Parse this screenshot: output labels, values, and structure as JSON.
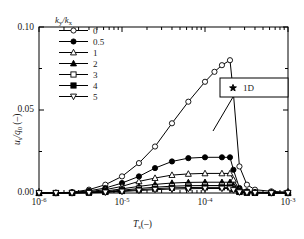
{
  "chart_data": {
    "type": "line",
    "title": "",
    "xlabel": "Ts(-)",
    "ylabel": "us/q0 (-)",
    "xscale": "log",
    "xlim": [
      1e-06,
      0.001
    ],
    "ylim": [
      0.0,
      0.1
    ],
    "yticks": [
      "0.00",
      "0.05",
      "0.10"
    ],
    "ytick_values": [
      0.0,
      0.05,
      0.1
    ],
    "xticks": [
      "10-6",
      "10-5",
      "10-4",
      "10-3"
    ],
    "xtick_values": [
      1e-06,
      1e-05,
      0.0001,
      0.001
    ],
    "grid": false,
    "legend_position": "upper-left-inside",
    "legend_title": "ky/kx",
    "series": [
      {
        "name": "0",
        "marker": "circle-open",
        "x": [
          1e-06,
          1.6e-06,
          2.5e-06,
          4e-06,
          6.3e-06,
          1e-05,
          1.6e-05,
          2.5e-05,
          4e-05,
          6.3e-05,
          0.0001,
          0.00013,
          0.00016,
          0.0002,
          0.00022,
          0.00026,
          0.00032,
          0.0004,
          0.00063,
          0.001
        ],
        "values": [
          0.0,
          0.0,
          0.0005,
          0.002,
          0.005,
          0.01,
          0.018,
          0.028,
          0.042,
          0.055,
          0.067,
          0.073,
          0.077,
          0.08,
          0.06,
          0.016,
          0.005,
          0.002,
          0.001,
          0.0005
        ]
      },
      {
        "name": "0.5",
        "marker": "circle-filled",
        "x": [
          1e-06,
          1.6e-06,
          2.5e-06,
          4e-06,
          6.3e-06,
          1e-05,
          1.6e-05,
          2.5e-05,
          4e-05,
          6.3e-05,
          0.0001,
          0.00016,
          0.0002,
          0.00022,
          0.00026,
          0.00032,
          0.0004,
          0.00063,
          0.001
        ],
        "values": [
          0.0,
          0.0,
          0.0003,
          0.0013,
          0.003,
          0.006,
          0.01,
          0.015,
          0.019,
          0.021,
          0.0215,
          0.0215,
          0.0215,
          0.014,
          0.003,
          0.001,
          0.0005,
          0.0003,
          0.0002
        ]
      },
      {
        "name": "1",
        "marker": "triangle-open",
        "x": [
          1e-06,
          1.6e-06,
          2.5e-06,
          4e-06,
          6.3e-06,
          1e-05,
          1.6e-05,
          2.5e-05,
          4e-05,
          6.3e-05,
          0.0001,
          0.00016,
          0.0002,
          0.00022,
          0.00026,
          0.00032,
          0.0004,
          0.00063,
          0.001
        ],
        "values": [
          0.0,
          0.0,
          0.0002,
          0.0008,
          0.002,
          0.004,
          0.007,
          0.009,
          0.0108,
          0.0115,
          0.0118,
          0.0118,
          0.0118,
          0.008,
          0.002,
          0.0007,
          0.0004,
          0.0002,
          0.0001
        ]
      },
      {
        "name": "2",
        "marker": "triangle-filled",
        "x": [
          1e-06,
          1.6e-06,
          2.5e-06,
          4e-06,
          6.3e-06,
          1e-05,
          1.6e-05,
          2.5e-05,
          4e-05,
          6.3e-05,
          0.0001,
          0.00016,
          0.0002,
          0.00022,
          0.00026,
          0.00032,
          0.0004,
          0.00063,
          0.001
        ],
        "values": [
          0.0,
          0.0,
          0.0001,
          0.0005,
          0.0012,
          0.0025,
          0.004,
          0.0052,
          0.006,
          0.0064,
          0.0065,
          0.0065,
          0.0065,
          0.0045,
          0.0012,
          0.0004,
          0.0002,
          0.0001,
          0.0001
        ]
      },
      {
        "name": "3",
        "marker": "square-open",
        "x": [
          1e-06,
          1.6e-06,
          2.5e-06,
          4e-06,
          6.3e-06,
          1e-05,
          1.6e-05,
          2.5e-05,
          4e-05,
          6.3e-05,
          0.0001,
          0.00016,
          0.0002,
          0.00022,
          0.00026,
          0.00032,
          0.0004,
          0.00063,
          0.001
        ],
        "values": [
          0.0,
          0.0,
          0.0001,
          0.0003,
          0.0008,
          0.0017,
          0.0027,
          0.0035,
          0.0041,
          0.0044,
          0.0045,
          0.0045,
          0.0045,
          0.0031,
          0.0008,
          0.0003,
          0.0001,
          0.0001,
          0.0
        ]
      },
      {
        "name": "4",
        "marker": "square-filled",
        "x": [
          1e-06,
          1.6e-06,
          2.5e-06,
          4e-06,
          6.3e-06,
          1e-05,
          1.6e-05,
          2.5e-05,
          4e-05,
          6.3e-05,
          0.0001,
          0.00016,
          0.0002,
          0.00022,
          0.00026,
          0.00032,
          0.0004,
          0.00063,
          0.001
        ],
        "values": [
          0.0,
          0.0,
          0.0,
          0.0002,
          0.0006,
          0.0012,
          0.002,
          0.0026,
          0.0031,
          0.0033,
          0.0034,
          0.0034,
          0.0034,
          0.0023,
          0.0006,
          0.0002,
          0.0001,
          0.0,
          0.0
        ]
      },
      {
        "name": "5",
        "marker": "triangle-down-open",
        "x": [
          1e-06,
          1.6e-06,
          2.5e-06,
          4e-06,
          6.3e-06,
          1e-05,
          1.6e-05,
          2.5e-05,
          4e-05,
          6.3e-05,
          0.0001,
          0.00016,
          0.0002,
          0.00022,
          0.00026,
          0.00032,
          0.0004,
          0.00063,
          0.001
        ],
        "values": [
          0.0,
          0.0,
          0.0,
          0.0001,
          0.0004,
          0.0009,
          0.0015,
          0.002,
          0.0024,
          0.0026,
          0.0027,
          0.0027,
          0.0027,
          0.0018,
          0.0005,
          0.0002,
          0.0001,
          0.0,
          0.0
        ]
      }
    ],
    "annotations": [
      {
        "text": "1D",
        "marker": "star-filled",
        "boxed": true,
        "leader": true
      }
    ]
  },
  "axes": {
    "y_label_main": "u",
    "y_label_sub1": "s",
    "y_label_mid": "/q",
    "y_label_sub2": "0",
    "y_label_unit": " (–)",
    "x_label_main": "T",
    "x_label_sub": "s",
    "x_label_unit": "(–)",
    "yticks": [
      "0.10",
      "0.05",
      "0.00"
    ],
    "xtick_mantissa": "10",
    "xtick_exponents": [
      "-6",
      "-5",
      "-4",
      "-3"
    ]
  },
  "legend": {
    "title_num": "k",
    "title_num_sub": "y",
    "title_slash": "/k",
    "title_den_sub": "x",
    "entries": [
      {
        "label": "0",
        "marker": "circle-open"
      },
      {
        "label": "0.5",
        "marker": "circle-filled"
      },
      {
        "label": "1",
        "marker": "triangle-open"
      },
      {
        "label": "2",
        "marker": "triangle-filled"
      },
      {
        "label": "3",
        "marker": "square-open"
      },
      {
        "label": "4",
        "marker": "square-filled"
      },
      {
        "label": "5",
        "marker": "triangle-down-open"
      }
    ]
  },
  "annotation": {
    "label": "1D",
    "marker": "star-filled"
  },
  "colors": {
    "line": "#000000",
    "axis": "#000000",
    "background": "#ffffff",
    "marker_fill_open": "#ffffff"
  }
}
